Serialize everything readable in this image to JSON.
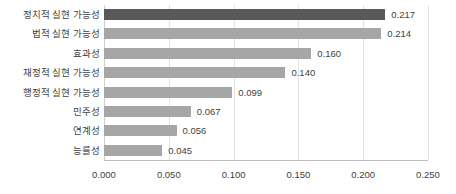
{
  "chart_data": {
    "type": "bar",
    "orientation": "horizontal",
    "title": "",
    "xlabel": "",
    "ylabel": "",
    "xlim": [
      0.0,
      0.25
    ],
    "grid": true,
    "legend": false,
    "categories": [
      "정치적 실현 가능성",
      "법적 실현 가능성",
      "효과성",
      "재정적 실현 가능성",
      "행정적 실현 가능성",
      "민주성",
      "연계성",
      "능률성"
    ],
    "values": [
      0.217,
      0.214,
      0.16,
      0.14,
      0.099,
      0.067,
      0.056,
      0.045
    ],
    "value_labels": [
      "0.217",
      "0.214",
      "0.160",
      "0.140",
      "0.099",
      "0.067",
      "0.056",
      "0.045"
    ],
    "tick_values": [
      0.0,
      0.05,
      0.1,
      0.15,
      0.2,
      0.25
    ],
    "tick_labels": [
      "0.000",
      "0.050",
      "0.100",
      "0.150",
      "0.200",
      "0.250"
    ],
    "colors": {
      "bar_default": "#a6a6a6",
      "bar_highlight": "#595959",
      "gridline": "#e2e2e2",
      "axis": "#bfbfbf",
      "text": "#3f3f3f",
      "background": "#ffffff"
    },
    "highlight_index": 0
  }
}
